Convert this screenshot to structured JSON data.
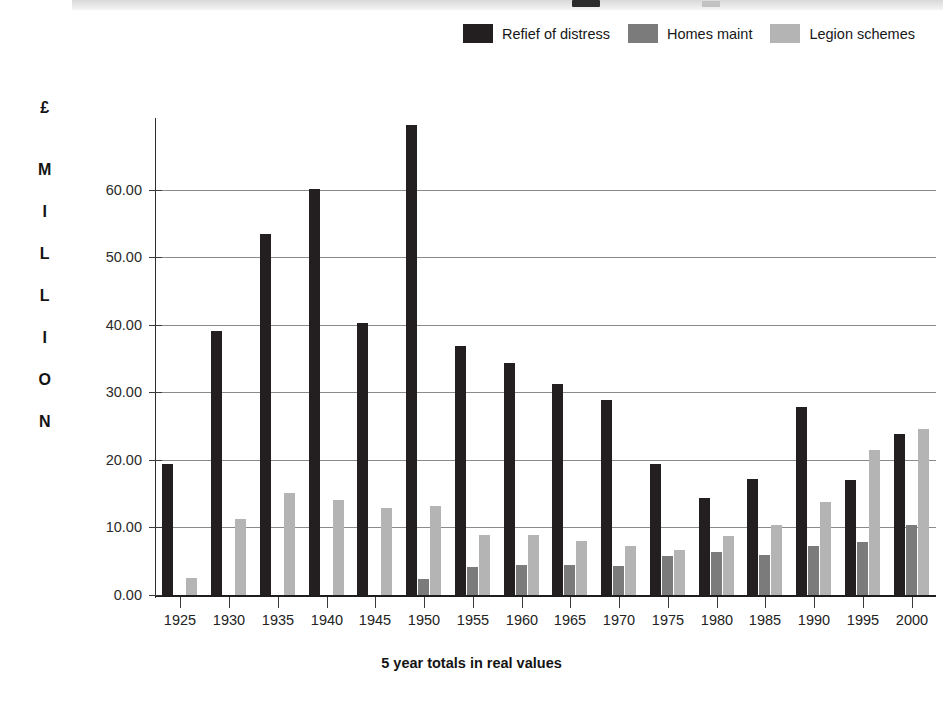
{
  "figure": {
    "kind": "bar-chart-figure",
    "background": "#ffffff",
    "cropped_title_band": true
  },
  "legend": {
    "position": "top-right",
    "items": [
      {
        "label": "Refief of distress",
        "color": "#231f20",
        "swatch_name": "legend-swatch-relief-of-distress"
      },
      {
        "label": "Homes maint",
        "color": "#7b7b7b",
        "swatch_name": "legend-swatch-homes-maint"
      },
      {
        "label": "Legion schemes",
        "color": "#b4b4b4",
        "swatch_name": "legend-swatch-legion-schemes"
      }
    ]
  },
  "y_axis": {
    "caption_letters": [
      "£",
      "M",
      "I",
      "L",
      "L",
      "I",
      "O",
      "N"
    ],
    "tick_labels": [
      "60.00",
      "50.00",
      "40.00",
      "30.00",
      "20.00",
      "10.00",
      "0.00"
    ],
    "ticks": [
      60,
      50,
      40,
      30,
      20,
      10,
      0
    ],
    "min": 0,
    "max": 70,
    "gridlines": true
  },
  "x_axis": {
    "title": "5 year totals in real values",
    "tick_labels": [
      "1925",
      "1930",
      "1935",
      "1940",
      "1945",
      "1950",
      "1955",
      "1960",
      "1965",
      "1970",
      "1975",
      "1980",
      "1985",
      "1990",
      "1995",
      "2000"
    ]
  },
  "chart_data": {
    "type": "bar",
    "title": "",
    "subtitle": "",
    "xlabel": "5 year totals in real values",
    "ylabel": "£ MILLION",
    "ylim": [
      0,
      70
    ],
    "grid": true,
    "legend_position": "top-right",
    "categories": [
      "1925",
      "1930",
      "1935",
      "1940",
      "1945",
      "1950",
      "1955",
      "1960",
      "1965",
      "1970",
      "1975",
      "1980",
      "1985",
      "1990",
      "1995",
      "2000"
    ],
    "series": [
      {
        "name": "Refief of distress",
        "color": "#231f20",
        "values": [
          19.4,
          39.1,
          53.5,
          60.1,
          40.2,
          69.5,
          36.9,
          34.3,
          31.2,
          28.8,
          19.4,
          14.3,
          17.2,
          27.8,
          17.0,
          23.8
        ]
      },
      {
        "name": "Homes maint",
        "color": "#7b7b7b",
        "values": [
          0,
          0,
          0,
          0,
          0,
          2.3,
          4.2,
          4.4,
          4.4,
          4.3,
          5.7,
          6.4,
          5.9,
          7.2,
          7.8,
          10.3
        ]
      },
      {
        "name": "Legion schemes",
        "color": "#b4b4b4",
        "values": [
          2.5,
          11.3,
          15.1,
          14.0,
          12.9,
          13.2,
          8.9,
          8.9,
          8.0,
          7.3,
          6.7,
          8.7,
          10.3,
          13.8,
          21.4,
          24.5
        ]
      }
    ],
    "annotations": []
  }
}
